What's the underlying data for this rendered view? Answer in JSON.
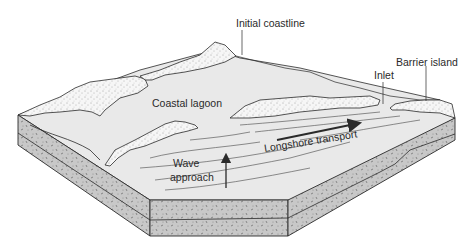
{
  "diagram": {
    "type": "block-diagram",
    "labels": {
      "initial_coastline": "Initial coastline",
      "barrier_island": "Barrier island",
      "inlet": "Inlet",
      "coastal_lagoon": "Coastal lagoon",
      "longshore_transport": "Longshore transport",
      "wave_approach_line1": "Wave",
      "wave_approach_line2": "approach"
    },
    "colors": {
      "background": "#ffffff",
      "water": "#e8e8e8",
      "block_side": "#c9c9c9",
      "sand": "#f4f4f4",
      "outline": "#2a2a2a"
    }
  }
}
